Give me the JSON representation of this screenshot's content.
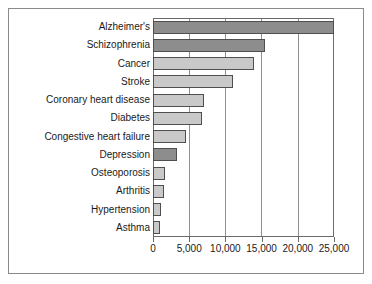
{
  "chart_data": {
    "type": "bar",
    "orientation": "horizontal",
    "title": "",
    "subtitle": "",
    "xlabel": "",
    "ylabel": "",
    "categories": [
      "Alzheimer's",
      "Schizophrenia",
      "Cancer",
      "Stroke",
      "Coronary heart disease",
      "Diabetes",
      "Congestive heart failure",
      "Depression",
      "Osteoporosis",
      "Arthritis",
      "Hypertension",
      "Asthma"
    ],
    "values": [
      25000,
      15500,
      14000,
      11000,
      7100,
      6700,
      4500,
      3300,
      1700,
      1500,
      1100,
      900
    ],
    "bar_styles": [
      "dark",
      "dark",
      "light",
      "light",
      "light",
      "light",
      "light",
      "dark",
      "light",
      "light",
      "light",
      "light"
    ],
    "xlim": [
      0,
      25000
    ],
    "xticks": [
      0,
      5000,
      10000,
      15000,
      20000,
      25000
    ],
    "xtick_labels": [
      "0",
      "5,000",
      "10,000",
      "15,000",
      "20,000",
      "25,000"
    ],
    "grid": "vertical",
    "legend": null,
    "colors": {
      "bar_dark": "#8d8d8d",
      "bar_light": "#c9c9c9",
      "bar_border": "#4f4f4f",
      "axis": "#6b6b6b",
      "gridline": "#8f8f8f",
      "frame": "#8a8a8a",
      "text": "#1a1a1a",
      "background": "#ffffff"
    }
  }
}
